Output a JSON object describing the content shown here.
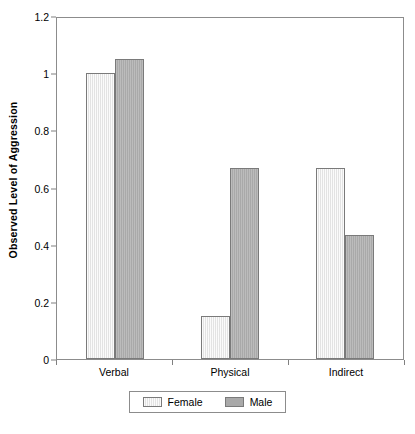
{
  "chart_data": {
    "type": "bar",
    "title": "",
    "xlabel": "",
    "ylabel": "Observed Level of Aggression",
    "categories": [
      "Verbal",
      "Physical",
      "Indirect"
    ],
    "series": [
      {
        "name": "Female",
        "color": "#e3e3e3",
        "values": [
          1.0,
          0.15,
          0.667
        ]
      },
      {
        "name": "Male",
        "color": "#a9a9a9",
        "values": [
          1.05,
          0.667,
          0.433
        ]
      }
    ],
    "ylim": [
      0,
      1.2
    ],
    "ytick_values": [
      0,
      0.2,
      0.4,
      0.6,
      0.8,
      1.0,
      1.2
    ],
    "ytick_labels": [
      "0",
      "0.2",
      "0.4",
      "0.6",
      "0.8",
      "1",
      "1.2"
    ],
    "grid": false,
    "legend_position": "bottom-center",
    "plot_border": true,
    "axis_color": "#8c8c8c"
  }
}
